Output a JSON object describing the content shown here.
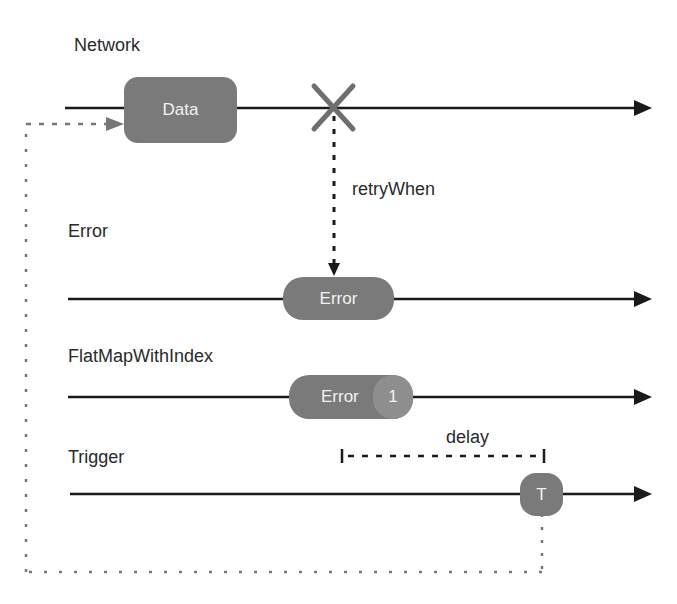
{
  "diagram": {
    "type": "marble-diagram",
    "timelines": [
      {
        "id": "network",
        "label": "Network"
      },
      {
        "id": "error",
        "label": "Error"
      },
      {
        "id": "flatmap",
        "label": "FlatMapWithIndex"
      },
      {
        "id": "trigger",
        "label": "Trigger"
      }
    ],
    "marbles": {
      "data": "Data",
      "error": "Error",
      "flatmap_error": "Error",
      "flatmap_index": "1",
      "trigger": "T"
    },
    "annotations": {
      "retry": "retryWhen",
      "delay": "delay"
    },
    "colors": {
      "line": "#1a1a1a",
      "marble": "#7a7a7a",
      "cross": "#6e6e6e",
      "dotted_feedback": "#777777",
      "text": "#2a2a2a"
    }
  }
}
